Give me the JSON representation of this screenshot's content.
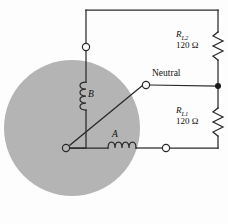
{
  "figure": {
    "type": "circuit-diagram",
    "background_color": "#fdfdfd",
    "wire_color": "#2a2a2a",
    "disc_color": "#b4b4b4"
  },
  "labels": {
    "neutral": "Neutral",
    "coil_a": "A",
    "coil_b": "B"
  },
  "resistors": [
    {
      "id": "RL2",
      "name_base": "R",
      "name_sub": "L2",
      "value": "120 Ω",
      "position": "upper-right"
    },
    {
      "id": "RL1",
      "name_base": "R",
      "name_sub": "L1",
      "value": "120 Ω",
      "position": "lower-right"
    }
  ],
  "terminals": [
    {
      "id": "terminal-top-left",
      "style": "open-circle",
      "x": 86,
      "y": 47
    },
    {
      "id": "terminal-neutral",
      "style": "open-circle",
      "x": 146,
      "y": 85
    },
    {
      "id": "terminal-bottom-right",
      "style": "open-circle",
      "x": 166,
      "y": 148
    },
    {
      "id": "junction-right-rail",
      "style": "solid-dot",
      "x": 218,
      "y": 86
    },
    {
      "id": "node-center",
      "style": "open-circle",
      "x": 66,
      "y": 148
    }
  ],
  "coils": [
    {
      "id": "coil-b",
      "orientation": "vertical",
      "label": "B"
    },
    {
      "id": "coil-a",
      "orientation": "horizontal",
      "label": "A"
    }
  ]
}
